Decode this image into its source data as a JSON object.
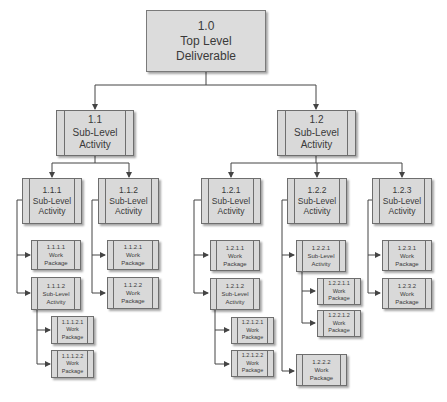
{
  "diagram": {
    "type": "work-breakdown-structure",
    "colors": {
      "box_fill": "#d9d9d9",
      "box_border": "#6e6e6e",
      "line": "#444444",
      "text": "#3a3a3a",
      "background": "#ffffff"
    },
    "nodes": {
      "n1_0": {
        "id": "1.0",
        "label_line1": "Top Level",
        "label_line2": "Deliverable"
      },
      "n1_1": {
        "id": "1.1",
        "label_line1": "Sub-Level",
        "label_line2": "Activity"
      },
      "n1_2": {
        "id": "1.2",
        "label_line1": "Sub-Level",
        "label_line2": "Activity"
      },
      "n1_1_1": {
        "id": "1.1.1",
        "label_line1": "Sub-Level",
        "label_line2": "Activity"
      },
      "n1_1_2": {
        "id": "1.1.2",
        "label_line1": "Sub-Level",
        "label_line2": "Activity"
      },
      "n1_1_1_1": {
        "id": "1.1.1.1",
        "label_line1": "Work",
        "label_line2": "Package"
      },
      "n1_1_1_2": {
        "id": "1.1.1.2",
        "label_line1": "Sub-Level",
        "label_line2": "Activity"
      },
      "n1_1_1_2_1": {
        "id": "1.1.1.2.1",
        "label_line1": "Work",
        "label_line2": "Package"
      },
      "n1_1_1_2_2": {
        "id": "1.1.1.2.2",
        "label_line1": "Work",
        "label_line2": "Package"
      },
      "n1_1_2_1": {
        "id": "1.1.2.1",
        "label_line1": "Work",
        "label_line2": "Package"
      },
      "n1_1_2_2": {
        "id": "1.1.2.2",
        "label_line1": "Work",
        "label_line2": "Package"
      },
      "n1_2_1": {
        "id": "1.2.1",
        "label_line1": "Sub-Level",
        "label_line2": "Activity"
      },
      "n1_2_2": {
        "id": "1.2.2",
        "label_line1": "Sub-Level",
        "label_line2": "Activity"
      },
      "n1_2_3": {
        "id": "1.2.3",
        "label_line1": "Sub-Level",
        "label_line2": "Activity"
      },
      "n1_2_1_1": {
        "id": "1.2.1.1",
        "label_line1": "Work",
        "label_line2": "Package"
      },
      "n1_2_1_2": {
        "id": "1.2.1.2",
        "label_line1": "Sub-Level",
        "label_line2": "Activity"
      },
      "n1_2_1_2_1": {
        "id": "1.2.1.2.1",
        "label_line1": "Work",
        "label_line2": "Package"
      },
      "n1_2_1_2_2": {
        "id": "1.2.1.2.2",
        "label_line1": "Work",
        "label_line2": "Package"
      },
      "n1_2_2_1": {
        "id": "1.2.2.1",
        "label_line1": "Sub-Level",
        "label_line2": "Activity"
      },
      "n1_2_2_1_1": {
        "id": "1.2.2.1.1",
        "label_line1": "Work",
        "label_line2": "Package"
      },
      "n1_2_2_1_2": {
        "id": "1.2.2.1.2",
        "label_line1": "Work",
        "label_line2": "Package"
      },
      "n1_2_2_2": {
        "id": "1.2.2.2",
        "label_line1": "Work",
        "label_line2": "Package"
      },
      "n1_2_3_1": {
        "id": "1.2.3.1",
        "label_line1": "Work",
        "label_line2": "Package"
      },
      "n1_2_3_2": {
        "id": "1.2.3.2",
        "label_line1": "Work",
        "label_line2": "Package"
      }
    },
    "edges": [
      [
        "1.0",
        "1.1"
      ],
      [
        "1.0",
        "1.2"
      ],
      [
        "1.1",
        "1.1.1"
      ],
      [
        "1.1",
        "1.1.2"
      ],
      [
        "1.1.1",
        "1.1.1.1"
      ],
      [
        "1.1.1",
        "1.1.1.2"
      ],
      [
        "1.1.1.2",
        "1.1.1.2.1"
      ],
      [
        "1.1.1.2",
        "1.1.1.2.2"
      ],
      [
        "1.1.2",
        "1.1.2.1"
      ],
      [
        "1.1.2",
        "1.1.2.2"
      ],
      [
        "1.2",
        "1.2.1"
      ],
      [
        "1.2",
        "1.2.2"
      ],
      [
        "1.2",
        "1.2.3"
      ],
      [
        "1.2.1",
        "1.2.1.1"
      ],
      [
        "1.2.1",
        "1.2.1.2"
      ],
      [
        "1.2.1.2",
        "1.2.1.2.1"
      ],
      [
        "1.2.1.2",
        "1.2.1.2.2"
      ],
      [
        "1.2.2",
        "1.2.2.1"
      ],
      [
        "1.2.2",
        "1.2.2.2"
      ],
      [
        "1.2.2.1",
        "1.2.2.1.1"
      ],
      [
        "1.2.2.1",
        "1.2.2.1.2"
      ],
      [
        "1.2.3",
        "1.2.3.1"
      ],
      [
        "1.2.3",
        "1.2.3.2"
      ]
    ]
  }
}
